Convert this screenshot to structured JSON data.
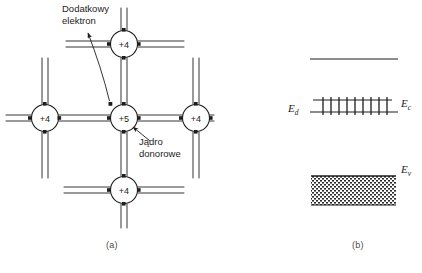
{
  "figure": {
    "panels": [
      {
        "id": "a",
        "caption": "(a)",
        "description": "silicon-lattice-with-donor"
      },
      {
        "id": "b",
        "caption": "(b)",
        "description": "energy-band-diagram"
      }
    ]
  },
  "lattice": {
    "annotations": {
      "extra_electron": {
        "line1": "Dodatkowy",
        "line2": "elektron"
      },
      "donor_nucleus": {
        "line1": "Jądro",
        "line2": "donorowe"
      }
    },
    "atoms": [
      {
        "name": "atom-top",
        "label": "+4",
        "cx": 124,
        "cy": 44
      },
      {
        "name": "atom-left",
        "label": "+4",
        "cx": 45,
        "cy": 118
      },
      {
        "name": "atom-center",
        "label": "+5",
        "cx": 124,
        "cy": 118
      },
      {
        "name": "atom-right",
        "label": "+4",
        "cx": 196,
        "cy": 118
      },
      {
        "name": "atom-bottom",
        "label": "+4",
        "cx": 124,
        "cy": 190
      }
    ],
    "atom_radius": 13.5
  },
  "bands": {
    "conduction_top_line": {
      "x1": 310,
      "x2": 398,
      "y": 59
    },
    "conduction_edge": {
      "x1": 310,
      "x2": 398,
      "y": 112,
      "label": "E",
      "sub": "c"
    },
    "donor_level": {
      "x1": 320,
      "x2": 388,
      "y": 100,
      "label": "E",
      "sub": "d",
      "electron_count": 9
    },
    "valence_band": {
      "x1": 311,
      "x2": 396,
      "y_top": 176,
      "y_bottom": 205,
      "label": "E",
      "sub": "v"
    }
  }
}
